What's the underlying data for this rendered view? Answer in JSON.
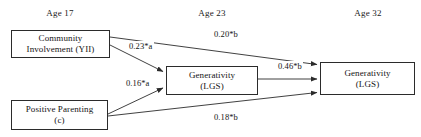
{
  "figure": {
    "type": "path-diagram",
    "background_color": "#ffffff",
    "line_color": "#2b2b2b",
    "text_color": "#141414"
  },
  "wave_headers": [
    {
      "label": "Age 17",
      "x": 24,
      "y": 8,
      "width": 72
    },
    {
      "label": "Age 23",
      "x": 176,
      "y": 8,
      "width": 72
    },
    {
      "label": "Age 32",
      "x": 332,
      "y": 8,
      "width": 72
    }
  ],
  "nodes": [
    {
      "id": "community-involvement",
      "lines": [
        "Community",
        "Involvement (YII)"
      ],
      "x": 11,
      "y": 30,
      "width": 99,
      "height": 28
    },
    {
      "id": "positive-parenting",
      "lines": [
        "Positive Parenting",
        "(c)"
      ],
      "x": 11,
      "y": 100,
      "width": 97,
      "height": 30
    },
    {
      "id": "generativity-age23",
      "lines": [
        "Generativity",
        "(LGS)"
      ],
      "x": 166,
      "y": 66,
      "width": 92,
      "height": 29
    },
    {
      "id": "generativity-age32",
      "lines": [
        "Generativity",
        "(LGS)"
      ],
      "x": 320,
      "y": 62,
      "width": 95,
      "height": 33
    }
  ],
  "paths": [
    {
      "id": "community-to-generativity23",
      "label": "0.23*b",
      "coefficient": "0.23*a",
      "from": "community-involvement",
      "to": "generativity-age23",
      "x1": 110,
      "y1": 45,
      "x2": 164,
      "y2": 72,
      "label_x": 128,
      "label_y": 42
    },
    {
      "id": "community-to-generativity32",
      "label": "0.20*b",
      "coefficient": "0.20*b",
      "from": "community-involvement",
      "to": "generativity-age32",
      "x1": 110,
      "y1": 37,
      "x2": 318,
      "y2": 65,
      "label_x": 213,
      "label_y": 30
    },
    {
      "id": "parenting-to-generativity23",
      "label": "0.16*a",
      "coefficient": "0.16*a",
      "from": "positive-parenting",
      "to": "generativity-age23",
      "x1": 108,
      "y1": 114,
      "x2": 164,
      "y2": 88,
      "label_x": 125,
      "label_y": 79
    },
    {
      "id": "generativity23-to-generativity32",
      "label": "0.46*b",
      "coefficient": "0.46*b",
      "from": "generativity-age23",
      "to": "generativity-age32",
      "x1": 258,
      "y1": 79,
      "x2": 318,
      "y2": 79,
      "label_x": 277,
      "label_y": 62
    },
    {
      "id": "parenting-to-generativity32",
      "label": "0.18*b",
      "coefficient": "0.18*b",
      "from": "positive-parenting",
      "to": "generativity-age32",
      "x1": 108,
      "y1": 116,
      "x2": 318,
      "y2": 93,
      "label_x": 213,
      "label_y": 113
    }
  ]
}
